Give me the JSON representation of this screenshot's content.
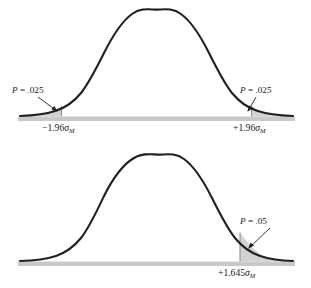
{
  "figure": {
    "colors": {
      "curve_stroke": "#231f20",
      "tail_fill": "#d2d2d2",
      "baseline_band": "#c9c9c9"
    }
  },
  "chart_data": {
    "type": "line",
    "title": "",
    "xlabel": "",
    "ylabel": "",
    "grid": false,
    "legend": null,
    "panels": [
      {
        "name": "two-tailed-test",
        "distribution": "standard normal",
        "mean": 0,
        "sd": 1,
        "total_alpha": 0.05,
        "tails": "two",
        "x": [
          -4,
          -3.5,
          -3,
          -2.5,
          -2,
          -1.96,
          -1.5,
          -1,
          -0.5,
          0,
          0.5,
          1,
          1.5,
          1.96,
          2,
          2.5,
          3,
          3.5,
          4
        ],
        "y": [
          0.0001,
          0.0009,
          0.0044,
          0.0175,
          0.054,
          0.0584,
          0.1295,
          0.242,
          0.3521,
          0.3989,
          0.3521,
          0.242,
          0.1295,
          0.0584,
          0.054,
          0.0175,
          0.0044,
          0.0009,
          0.0001
        ],
        "critical_values": [
          -1.96,
          1.96
        ],
        "shaded_regions": [
          {
            "from": -4,
            "to": -1.96,
            "area": 0.025,
            "label": "P = .025"
          },
          {
            "from": 1.96,
            "to": 4,
            "area": 0.025,
            "label": "P = .025"
          }
        ],
        "annotations": [
          {
            "name": "left-tail-probability",
            "text_p": "P",
            "text_eq": " = ",
            "text_value": ".025"
          },
          {
            "name": "right-tail-probability",
            "text_p": "P",
            "text_eq": " = ",
            "text_value": ".025"
          }
        ],
        "tick_labels": [
          {
            "name": "left-critical-tick",
            "sign": "−",
            "value": "1.96",
            "symbol": "σ",
            "subscript": "M"
          },
          {
            "name": "right-critical-tick",
            "sign": "+",
            "value": "1.96",
            "symbol": "σ",
            "subscript": "M"
          }
        ]
      },
      {
        "name": "one-tailed-test",
        "distribution": "standard normal",
        "mean": 0,
        "sd": 1,
        "total_alpha": 0.05,
        "tails": "one",
        "x": [
          -4,
          -3.5,
          -3,
          -2.5,
          -2,
          -1.5,
          -1,
          -0.5,
          0,
          0.5,
          1,
          1.5,
          1.645,
          2,
          2.5,
          3,
          3.5,
          4
        ],
        "y": [
          0.0001,
          0.0009,
          0.0044,
          0.0175,
          0.054,
          0.1295,
          0.242,
          0.3521,
          0.3989,
          0.3521,
          0.242,
          0.1295,
          0.1031,
          0.054,
          0.0175,
          0.0044,
          0.0009,
          0.0001
        ],
        "critical_values": [
          1.645
        ],
        "shaded_regions": [
          {
            "from": 1.645,
            "to": 4,
            "area": 0.05,
            "label": "P = .05"
          }
        ],
        "annotations": [
          {
            "name": "right-tail-probability",
            "text_p": "P",
            "text_eq": " = ",
            "text_value": ".05"
          }
        ],
        "tick_labels": [
          {
            "name": "right-critical-tick",
            "sign": "+",
            "value": "1.645",
            "symbol": "σ",
            "subscript": "M"
          }
        ]
      }
    ]
  }
}
